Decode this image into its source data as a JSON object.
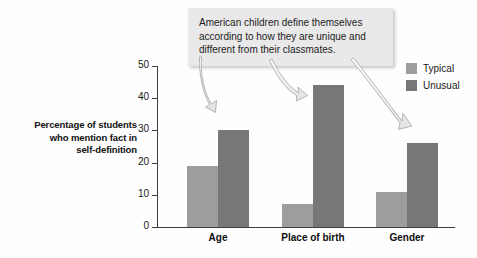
{
  "chart_data": {
    "type": "bar",
    "title": "",
    "xlabel": "",
    "ylabel": "Percentage of students who mention fact in self-definition",
    "categories": [
      "Age",
      "Place of birth",
      "Gender"
    ],
    "series": [
      {
        "name": "Typical",
        "color": "#9d9d9d",
        "values": [
          19,
          7,
          11
        ]
      },
      {
        "name": "Unusual",
        "color": "#777777",
        "values": [
          30,
          44,
          26
        ]
      }
    ],
    "ylim": [
      0,
      50
    ],
    "yticks": [
      0,
      10,
      20,
      30,
      40,
      50
    ],
    "ytick_labels": [
      "0",
      "10",
      "20",
      "30",
      "40",
      "50"
    ],
    "grid": false,
    "legend_position": "top-right"
  },
  "y_axis": {
    "title_line1": "Percentage of students",
    "title_line2": "who mention fact in",
    "title_line3": "self-definition"
  },
  "legend": {
    "items": [
      {
        "label": "Typical",
        "color": "#9d9d9d"
      },
      {
        "label": "Unusual",
        "color": "#777777"
      }
    ]
  },
  "callout": {
    "text": "American children define themselves according to how they are unique and different from their classmates.",
    "background": "#e9e9e9",
    "arrow_targets": [
      "Age / Unusual bar",
      "Place of birth / Unusual bar",
      "Gender / Unusual bar"
    ]
  }
}
